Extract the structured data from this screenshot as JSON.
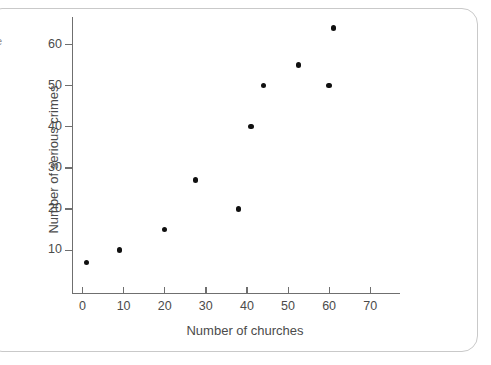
{
  "chart_data": {
    "type": "scatter",
    "title": "",
    "xlabel": "Number of churches",
    "ylabel": "Number of serious crimes",
    "xlim": [
      -2,
      78
    ],
    "ylim": [
      0,
      67
    ],
    "xticks": [
      0,
      10,
      20,
      30,
      40,
      50,
      60,
      70
    ],
    "yticks": [
      10,
      20,
      30,
      40,
      50,
      60
    ],
    "xtick_labels": [
      "0",
      "10",
      "20",
      "30",
      "40",
      "50",
      "60",
      "70"
    ],
    "ytick_labels": [
      "10",
      "20",
      "30",
      "40",
      "50",
      "60"
    ],
    "grid": false,
    "legend": null,
    "points": [
      {
        "x": 1,
        "y": 7
      },
      {
        "x": 9,
        "y": 10
      },
      {
        "x": 20,
        "y": 15
      },
      {
        "x": 27.5,
        "y": 27
      },
      {
        "x": 38,
        "y": 20
      },
      {
        "x": 41,
        "y": 40
      },
      {
        "x": 44,
        "y": 50
      },
      {
        "x": 52.5,
        "y": 55
      },
      {
        "x": 60,
        "y": 50
      },
      {
        "x": 61,
        "y": 64
      }
    ],
    "marker": "filled-circle",
    "marker_color": "#101010"
  },
  "figure": {
    "frame_color": "#c9c9c9",
    "axis_color": "#6f6f6f",
    "text_color": "#4b4b4b",
    "background": "#ffffff",
    "edge_fragment_text": "e"
  }
}
